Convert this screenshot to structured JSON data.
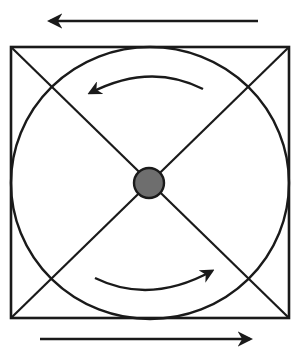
{
  "diagram": {
    "colors": {
      "stroke": "#1a1a1a",
      "hub_fill": "#6e6e6e",
      "background": "#ffffff"
    },
    "square": {
      "x": 11,
      "y": 47,
      "width": 278,
      "height": 271
    },
    "circle": {
      "cx": 150,
      "cy": 183,
      "rx": 139,
      "ry": 136
    },
    "hub": {
      "cx": 149,
      "cy": 183,
      "r": 15
    },
    "arrows": {
      "top_straight": {
        "direction": "left",
        "y": 21,
        "x_start": 258,
        "x_end": 47
      },
      "bottom_straight": {
        "direction": "right",
        "y": 339,
        "x_start": 40,
        "x_end": 253
      },
      "top_curved": {
        "direction": "counter-clockwise",
        "label": ""
      },
      "bottom_curved": {
        "direction": "counter-clockwise",
        "label": ""
      }
    }
  }
}
